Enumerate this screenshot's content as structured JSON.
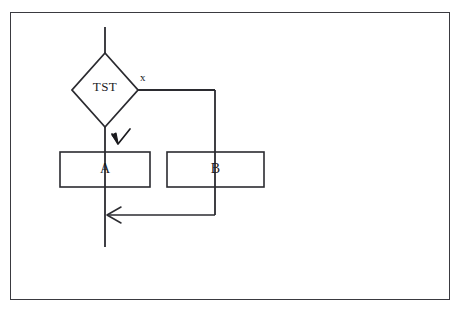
{
  "diagram": {
    "background_color": "#ffffff",
    "frame": {
      "name": "outer-border",
      "stroke_color": "#3a3a40",
      "x": 10,
      "y": 12,
      "width": 440,
      "height": 288
    },
    "stroke_color": "#2b2b30",
    "text_color": "#1b1b1f",
    "nodes": [
      {
        "id": "tst",
        "shape": "diamond",
        "label": "TST",
        "cx": 105,
        "cy": 90,
        "rx": 33,
        "ry": 37
      },
      {
        "id": "a",
        "shape": "rect",
        "label": "A",
        "x": 60,
        "y": 152,
        "width": 90,
        "height": 35
      },
      {
        "id": "b",
        "shape": "rect",
        "label": "B",
        "x": 167,
        "y": 152,
        "width": 97,
        "height": 35
      }
    ],
    "edge_labels": [
      {
        "id": "x",
        "label": "x",
        "x": 140,
        "y": 72
      }
    ],
    "annotations": [
      {
        "id": "check-mark",
        "kind": "handdrawn-arrowhead",
        "x": 118,
        "y": 136
      }
    ],
    "arrows": [
      {
        "id": "merge-arrow",
        "direction": "left",
        "x": 108,
        "y": 215
      }
    ]
  }
}
